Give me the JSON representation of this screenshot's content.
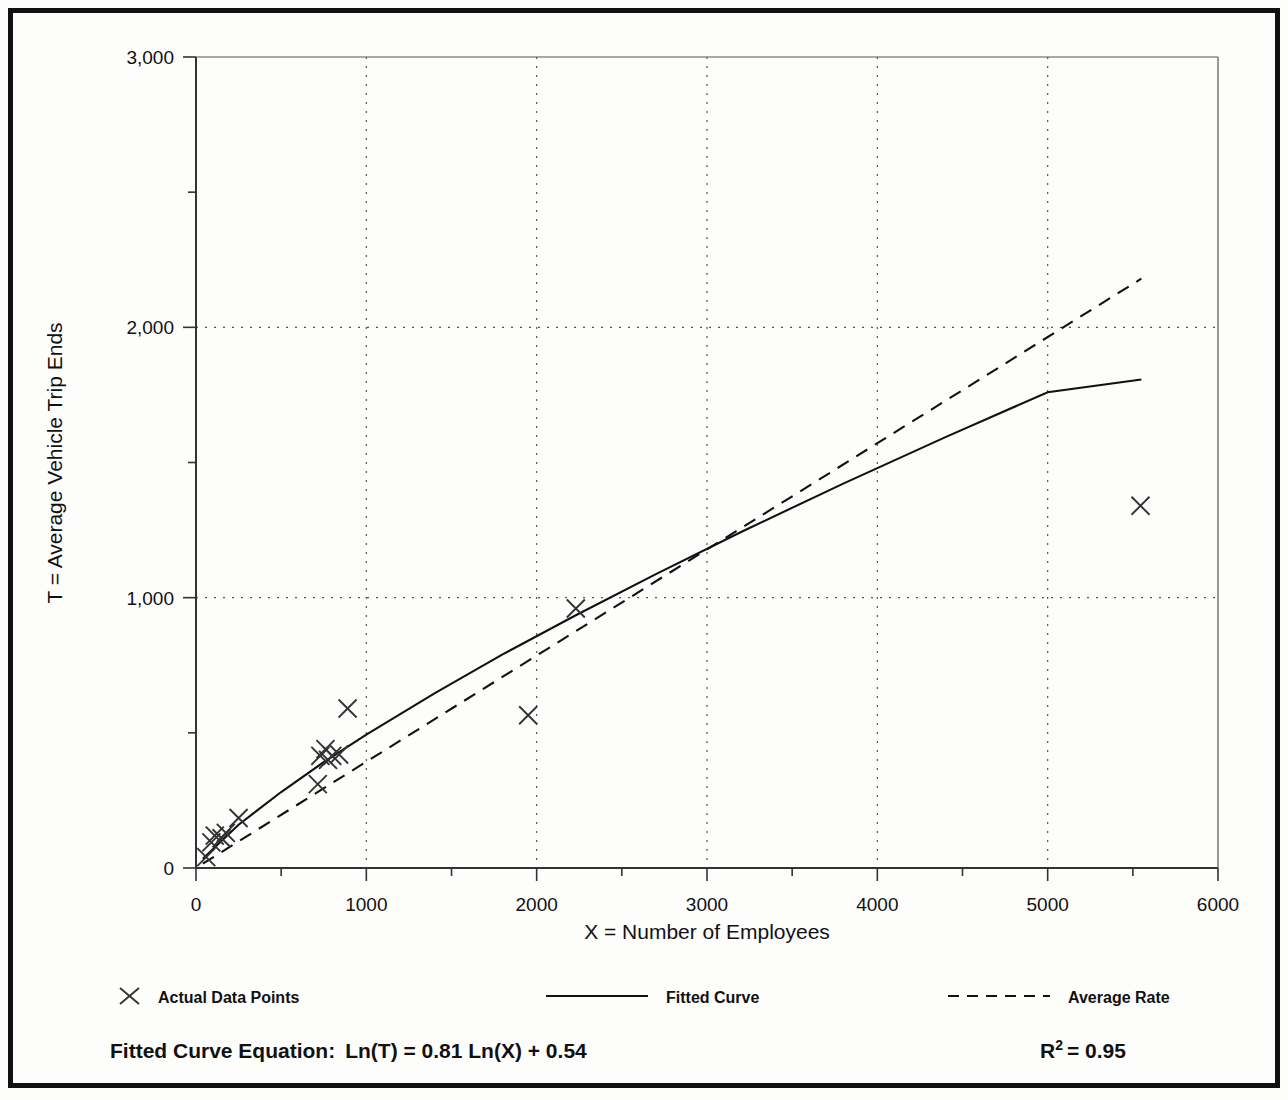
{
  "chart_data": {
    "type": "scatter",
    "title": "",
    "xlabel": "X = Number of Employees",
    "ylabel": "T = Average Vehicle Trip Ends",
    "xlim": [
      0,
      6000
    ],
    "ylim": [
      0,
      3000
    ],
    "xticks": [
      0,
      1000,
      2000,
      3000,
      4000,
      5000,
      6000
    ],
    "xtick_labels": [
      "0",
      "1000",
      "2000",
      "3000",
      "4000",
      "5000",
      "6000"
    ],
    "x_minor_tick_step": 500,
    "yticks": [
      0,
      1000,
      2000,
      3000
    ],
    "ytick_labels": [
      "0",
      "1,000",
      "2,000",
      "3,000"
    ],
    "y_minor_tick_step": 500,
    "grid": "dotted gridlines at major x and y ticks",
    "legend_position": "below-axis",
    "series": [
      {
        "name": "Actual Data Points",
        "marker": "x",
        "style": "scatter",
        "points": [
          [
            60,
            40
          ],
          [
            90,
            95
          ],
          [
            110,
            120
          ],
          [
            150,
            110
          ],
          [
            175,
            130
          ],
          [
            250,
            185
          ],
          [
            715,
            310
          ],
          [
            730,
            415
          ],
          [
            760,
            440
          ],
          [
            775,
            400
          ],
          [
            800,
            415
          ],
          [
            840,
            420
          ],
          [
            890,
            590
          ],
          [
            1950,
            565
          ],
          [
            2230,
            960
          ],
          [
            5545,
            1340
          ]
        ]
      },
      {
        "name": "Fitted Curve",
        "style": "solid-line",
        "equation": "Ln(T) = 0.81 Ln(X) + 0.54",
        "x_range": [
          40,
          5550
        ],
        "sampled": [
          [
            40,
            34
          ],
          [
            250,
            160
          ],
          [
            500,
            281
          ],
          [
            750,
            392
          ],
          [
            1000,
            493
          ],
          [
            1400,
            646
          ],
          [
            1800,
            790
          ],
          [
            2230,
            935
          ],
          [
            2700,
            1087
          ],
          [
            3200,
            1243
          ],
          [
            3800,
            1422
          ],
          [
            4400,
            1594
          ],
          [
            5000,
            1760
          ],
          [
            5550,
            1807
          ]
        ]
      },
      {
        "name": "Average Rate",
        "style": "dashed-line",
        "x_range": [
          40,
          5550
        ],
        "slope_per_employee": 0.393,
        "endpoints": [
          [
            40,
            16
          ],
          [
            5550,
            2180
          ]
        ]
      }
    ]
  },
  "axes": {
    "y_title": "T = Average Vehicle Trip Ends",
    "x_title": "X = Number of Employees"
  },
  "legend": {
    "items": [
      {
        "label": "Actual Data Points",
        "symbol": "x-marker"
      },
      {
        "label": "Fitted Curve",
        "symbol": "solid-line"
      },
      {
        "label": "Average Rate",
        "symbol": "dashed-line"
      }
    ]
  },
  "footer": {
    "equation_label": "Fitted Curve Equation:",
    "equation": "Ln(T) = 0.81 Ln(X) + 0.54",
    "r2_base": "R",
    "r2_exponent": "2",
    "r2_value": "= 0.95"
  },
  "colors": {
    "ink": "#111111",
    "paper": "#fdfdfc",
    "grid": "#555555"
  }
}
